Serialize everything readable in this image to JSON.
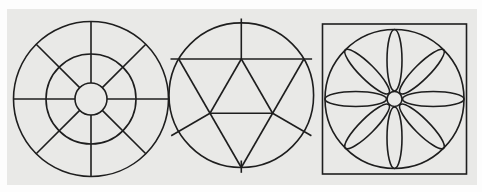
{
  "canvas": {
    "width": 482,
    "height": 192,
    "background": "#fdfdfd"
  },
  "panel": {
    "x": 7,
    "y": 9,
    "width": 470,
    "height": 176,
    "color": "#e9e9e7"
  },
  "stroke": {
    "color": "#1e1e1e",
    "width": 1.6
  },
  "figures": [
    {
      "name": "spoked-wheel",
      "center": {
        "cx": 91,
        "cy": 99
      },
      "circles": [
        {
          "name": "outer-circle",
          "cx": 91,
          "cy": 99,
          "r": 77.5
        },
        {
          "name": "middle-circle",
          "cx": 91,
          "cy": 99,
          "r": 45
        },
        {
          "name": "hub-circle",
          "cx": 91,
          "cy": 99,
          "r": 16
        }
      ],
      "segments": [
        {
          "name": "spoke-east",
          "points": [
            107,
            99,
            168.5,
            99
          ]
        },
        {
          "name": "spoke-northeast",
          "points": [
            102.31,
            87.69,
            145.8,
            44.2
          ]
        },
        {
          "name": "spoke-north",
          "points": [
            91,
            83,
            91,
            21.5
          ]
        },
        {
          "name": "spoke-northwest",
          "points": [
            79.69,
            87.69,
            36.2,
            44.2
          ]
        },
        {
          "name": "spoke-west",
          "points": [
            75,
            99,
            13.5,
            99
          ]
        },
        {
          "name": "spoke-southwest",
          "points": [
            79.69,
            110.31,
            36.2,
            153.8
          ]
        },
        {
          "name": "spoke-south",
          "points": [
            91,
            115,
            91,
            176.5
          ]
        },
        {
          "name": "spoke-southeast",
          "points": [
            102.31,
            110.31,
            145.8,
            153.8
          ]
        }
      ]
    },
    {
      "name": "triangle-construction",
      "center": {
        "cx": 241.3,
        "cy": 95.2
      },
      "circles": [
        {
          "name": "construction-circle",
          "cx": 241.3,
          "cy": 95.2,
          "r": 72.3
        }
      ],
      "segments": [
        {
          "name": "top-radial-tick",
          "points": [
            241.3,
            18.5,
            241.3,
            59
          ]
        },
        {
          "name": "extended-top-chord",
          "points": [
            170.5,
            59,
            312.1,
            59
          ]
        },
        {
          "name": "triangle-left-side",
          "points": [
            178.7,
            59,
            241.3,
            167.5
          ]
        },
        {
          "name": "triangle-right-side",
          "points": [
            303.9,
            59,
            241.3,
            167.5
          ]
        },
        {
          "name": "bottom-radial-tick",
          "points": [
            241.3,
            160.5,
            241.3,
            172.8
          ]
        },
        {
          "name": "medial-left-side",
          "points": [
            241.3,
            59,
            210.0,
            113.25
          ]
        },
        {
          "name": "medial-right-side",
          "points": [
            241.3,
            59,
            272.6,
            113.25
          ]
        },
        {
          "name": "medial-base",
          "points": [
            210.0,
            113.25,
            272.6,
            113.25
          ]
        },
        {
          "name": "lower-left-extension",
          "points": [
            210.0,
            113.25,
            171.2,
            135.7
          ]
        },
        {
          "name": "lower-right-extension",
          "points": [
            272.6,
            113.25,
            311.4,
            135.7
          ]
        }
      ]
    },
    {
      "name": "petal-rosette",
      "center": {
        "cx": 394.5,
        "cy": 99
      },
      "rects": [
        {
          "name": "bounding-square",
          "x": 322.5,
          "y": 24,
          "w": 144,
          "h": 150
        }
      ],
      "circles": [
        {
          "name": "rosette-circle",
          "cx": 394.5,
          "cy": 99,
          "r": 69.5
        },
        {
          "name": "hub-circle",
          "cx": 394.5,
          "cy": 99,
          "r": 7.5
        }
      ],
      "ellipses": [
        {
          "name": "petal-east",
          "cx": 433.25,
          "cy": 99,
          "rx": 30.75,
          "ry": 7.5,
          "rot": 0
        },
        {
          "name": "petal-northeast",
          "cx": 421.9,
          "cy": 71.6,
          "rx": 30.75,
          "ry": 7.5,
          "rot": -45
        },
        {
          "name": "petal-north",
          "cx": 394.5,
          "cy": 60.25,
          "rx": 30.75,
          "ry": 7.5,
          "rot": 90
        },
        {
          "name": "petal-northwest",
          "cx": 367.1,
          "cy": 71.6,
          "rx": 30.75,
          "ry": 7.5,
          "rot": 45
        },
        {
          "name": "petal-west",
          "cx": 355.75,
          "cy": 99,
          "rx": 30.75,
          "ry": 7.5,
          "rot": 0
        },
        {
          "name": "petal-southwest",
          "cx": 367.1,
          "cy": 126.4,
          "rx": 30.75,
          "ry": 7.5,
          "rot": -45
        },
        {
          "name": "petal-south",
          "cx": 394.5,
          "cy": 137.75,
          "rx": 30.75,
          "ry": 7.5,
          "rot": 90
        },
        {
          "name": "petal-southeast",
          "cx": 421.9,
          "cy": 126.4,
          "rx": 30.75,
          "ry": 7.5,
          "rot": 45
        }
      ]
    }
  ]
}
